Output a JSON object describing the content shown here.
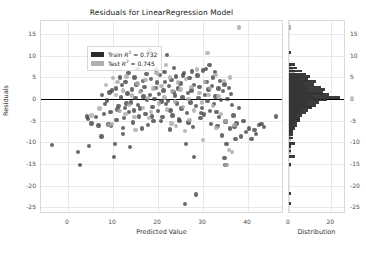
{
  "chart_data": {
    "type": "scatter",
    "title": "Residuals for LinearRegression Model",
    "xlabel": "Predicted Value",
    "ylabel": "Residuals",
    "xlim": [
      -6,
      48
    ],
    "ylim": [
      -26.5,
      18
    ],
    "xticks": [
      0,
      10,
      20,
      30,
      40
    ],
    "yticks": [
      15,
      10,
      5,
      0,
      -5,
      -10,
      -15,
      -20,
      -25
    ],
    "grid": true,
    "zero_line": 0,
    "legend": {
      "position": "upper-left",
      "entries": [
        {
          "name": "train",
          "label_prefix": "Train ",
          "label_r": "R",
          "label_sup": "2",
          "label_suffix": " = 0.732",
          "value": 0.732,
          "color": "#2b2b2b"
        },
        {
          "name": "test",
          "label_prefix": "Test ",
          "label_r": "R",
          "label_sup": "2",
          "label_suffix": " = 0.745",
          "value": 0.745,
          "color": "#b0b0b0"
        }
      ]
    },
    "series": [
      {
        "name": "Train",
        "color": "#3f3f3f",
        "points": [
          [
            -3.6,
            -10.6
          ],
          [
            2.2,
            -12.2
          ],
          [
            2.6,
            -15.2
          ],
          [
            4.6,
            -10.8
          ],
          [
            4.2,
            -4.0
          ],
          [
            4.5,
            -4.6
          ],
          [
            5.2,
            -5.6
          ],
          [
            6.8,
            -6.1
          ],
          [
            7.4,
            -8.6
          ],
          [
            8.0,
            -3.5
          ],
          [
            8.6,
            -0.3
          ],
          [
            9.0,
            -5.9
          ],
          [
            9.6,
            -6.2
          ],
          [
            10.2,
            -13.4
          ],
          [
            10.4,
            -10.3
          ],
          [
            9.2,
            1.5
          ],
          [
            9.8,
            2.0
          ],
          [
            10.6,
            2.4
          ],
          [
            11.2,
            -1.6
          ],
          [
            11.0,
            -2.4
          ],
          [
            11.8,
            0.4
          ],
          [
            12.2,
            -6.6
          ],
          [
            12.6,
            -2.0
          ],
          [
            12.0,
            3.2
          ],
          [
            12.8,
            4.0
          ],
          [
            13.2,
            1.3
          ],
          [
            13.0,
            -1.0
          ],
          [
            13.6,
            -3.0
          ],
          [
            13.8,
            -11.0
          ],
          [
            14.2,
            2.2
          ],
          [
            14.0,
            -0.8
          ],
          [
            14.6,
            -2.6
          ],
          [
            14.8,
            5.0
          ],
          [
            15.2,
            3.4
          ],
          [
            15.0,
            0.2
          ],
          [
            15.6,
            -1.4
          ],
          [
            15.8,
            -4.0
          ],
          [
            16.2,
            1.8
          ],
          [
            16.0,
            -2.2
          ],
          [
            16.6,
            4.2
          ],
          [
            16.8,
            0.6
          ],
          [
            17.2,
            -3.4
          ],
          [
            17.0,
            2.8
          ],
          [
            17.6,
            -0.2
          ],
          [
            17.8,
            -6.0
          ],
          [
            18.0,
            11.2
          ],
          [
            18.4,
            4.6
          ],
          [
            18.2,
            1.0
          ],
          [
            18.8,
            -1.8
          ],
          [
            19.0,
            -5.1
          ],
          [
            19.4,
            2.6
          ],
          [
            19.2,
            0.0
          ],
          [
            19.8,
            3.8
          ],
          [
            20.0,
            -2.8
          ],
          [
            20.4,
            5.6
          ],
          [
            20.2,
            1.2
          ],
          [
            20.8,
            -0.6
          ],
          [
            21.0,
            -4.2
          ],
          [
            21.4,
            6.2
          ],
          [
            21.2,
            2.0
          ],
          [
            21.8,
            -1.2
          ],
          [
            22.0,
            10.2
          ],
          [
            22.4,
            3.0
          ],
          [
            22.2,
            -0.4
          ],
          [
            22.8,
            -2.6
          ],
          [
            23.0,
            4.4
          ],
          [
            23.4,
            1.6
          ],
          [
            23.2,
            -3.8
          ],
          [
            23.8,
            0.8
          ],
          [
            24.0,
            5.2
          ],
          [
            24.4,
            2.4
          ],
          [
            24.2,
            -1.0
          ],
          [
            24.8,
            -5.0
          ],
          [
            25.0,
            3.6
          ],
          [
            25.4,
            0.4
          ],
          [
            25.2,
            -2.2
          ],
          [
            25.8,
            6.0
          ],
          [
            26.0,
            -24.2
          ],
          [
            26.2,
            -10.4
          ],
          [
            26.6,
            1.4
          ],
          [
            26.4,
            -3.2
          ],
          [
            27.0,
            4.8
          ],
          [
            27.4,
            2.0
          ],
          [
            27.2,
            -0.8
          ],
          [
            27.8,
            -6.4
          ],
          [
            28.0,
            3.2
          ],
          [
            28.4,
            -1.6
          ],
          [
            28.5,
            -22.0
          ],
          [
            28.8,
            5.4
          ],
          [
            29.0,
            0.2
          ],
          [
            29.4,
            -4.4
          ],
          [
            29.2,
            2.8
          ],
          [
            29.8,
            -2.0
          ],
          [
            30.0,
            6.6
          ],
          [
            30.4,
            1.0
          ],
          [
            30.2,
            -3.6
          ],
          [
            30.8,
            4.0
          ],
          [
            31.0,
            -0.4
          ],
          [
            31.4,
            7.8
          ],
          [
            31.2,
            2.2
          ],
          [
            31.8,
            -5.8
          ],
          [
            32.0,
            3.0
          ],
          [
            32.4,
            -1.2
          ],
          [
            32.2,
            5.0
          ],
          [
            32.8,
            0.6
          ],
          [
            33.0,
            -3.0
          ],
          [
            33.4,
            2.4
          ],
          [
            33.2,
            -6.2
          ],
          [
            33.8,
            4.2
          ],
          [
            34.0,
            -0.2
          ],
          [
            34.4,
            1.8
          ],
          [
            34.2,
            -8.4
          ],
          [
            34.8,
            3.4
          ],
          [
            35.0,
            -5.2
          ],
          [
            35.4,
            0.0
          ],
          [
            35.2,
            -10.4
          ],
          [
            35.8,
            2.6
          ],
          [
            36.0,
            -6.8
          ],
          [
            36.4,
            -1.4
          ],
          [
            36.2,
            1.2
          ],
          [
            36.8,
            -3.8
          ],
          [
            37.0,
            -6.4
          ],
          [
            37.4,
            -5.6
          ],
          [
            37.2,
            -9.2
          ],
          [
            38.0,
            -2.0
          ],
          [
            38.4,
            -8.6
          ],
          [
            39.0,
            -5.0
          ],
          [
            39.6,
            -7.6
          ],
          [
            40.2,
            -6.8
          ],
          [
            40.8,
            -9.2
          ],
          [
            41.4,
            -7.2
          ],
          [
            41.8,
            -8.0
          ],
          [
            42.4,
            -6.0
          ],
          [
            43.0,
            -5.8
          ],
          [
            43.6,
            -6.4
          ],
          [
            46.2,
            -4.0
          ],
          [
            28.0,
            -13.4
          ],
          [
            34.8,
            -13.6
          ],
          [
            35.0,
            -15.2
          ],
          [
            7.5,
            1.0
          ],
          [
            8.2,
            -1.2
          ],
          [
            10.8,
            -4.8
          ],
          [
            11.5,
            5.0
          ],
          [
            12.4,
            -4.4
          ],
          [
            13.4,
            6.0
          ],
          [
            14.4,
            -5.4
          ],
          [
            15.4,
            7.0
          ],
          [
            16.4,
            -6.8
          ],
          [
            17.4,
            5.8
          ],
          [
            18.6,
            -4.0
          ],
          [
            19.6,
            6.8
          ],
          [
            20.6,
            -5.0
          ],
          [
            21.6,
            4.0
          ],
          [
            22.6,
            -7.0
          ],
          [
            23.6,
            7.2
          ],
          [
            24.6,
            -4.6
          ],
          [
            25.6,
            5.4
          ],
          [
            26.8,
            -5.4
          ],
          [
            27.6,
            6.4
          ],
          [
            29.6,
            -3.2
          ],
          [
            30.6,
            7.0
          ],
          [
            31.6,
            -2.8
          ],
          [
            32.6,
            6.2
          ],
          [
            33.6,
            -4.2
          ],
          [
            12.2,
            -8.0
          ],
          [
            9.4,
            -3.0
          ],
          [
            6.2,
            -4.2
          ]
        ]
      },
      {
        "name": "Test",
        "color": "#a9a9a9",
        "points": [
          [
            5.2,
            -3.8
          ],
          [
            7.0,
            -2.2
          ],
          [
            8.4,
            3.2
          ],
          [
            9.2,
            -6.0
          ],
          [
            10.0,
            4.8
          ],
          [
            10.6,
            1.0
          ],
          [
            11.4,
            -2.8
          ],
          [
            12.2,
            2.0
          ],
          [
            13.0,
            5.2
          ],
          [
            13.6,
            -1.4
          ],
          [
            14.2,
            0.8
          ],
          [
            14.8,
            -4.2
          ],
          [
            15.4,
            3.6
          ],
          [
            16.0,
            1.6
          ],
          [
            16.6,
            -2.0
          ],
          [
            17.2,
            4.4
          ],
          [
            17.8,
            0.2
          ],
          [
            18.4,
            -3.0
          ],
          [
            19.0,
            2.4
          ],
          [
            19.6,
            6.0
          ],
          [
            20.2,
            -1.0
          ],
          [
            20.8,
            3.0
          ],
          [
            21.4,
            0.4
          ],
          [
            22.0,
            -2.4
          ],
          [
            22.6,
            5.0
          ],
          [
            23.2,
            1.8
          ],
          [
            23.8,
            -0.6
          ],
          [
            24.4,
            3.8
          ],
          [
            25.0,
            2.2
          ],
          [
            25.6,
            -1.8
          ],
          [
            26.2,
            4.6
          ],
          [
            26.8,
            0.0
          ],
          [
            27.4,
            2.8
          ],
          [
            28.0,
            -2.6
          ],
          [
            28.6,
            6.8
          ],
          [
            29.2,
            1.4
          ],
          [
            29.8,
            -0.8
          ],
          [
            30.4,
            4.0
          ],
          [
            31.0,
            10.6
          ],
          [
            31.6,
            2.6
          ],
          [
            32.2,
            -1.6
          ],
          [
            32.8,
            5.6
          ],
          [
            33.4,
            0.6
          ],
          [
            34.0,
            -3.4
          ],
          [
            34.6,
            4.2
          ],
          [
            35.2,
            -15.2
          ],
          [
            35.8,
            -11.8
          ],
          [
            36.4,
            -12.2
          ],
          [
            36.0,
            5.0
          ],
          [
            37.0,
            -6.0
          ],
          [
            38.0,
            16.5
          ],
          [
            21.8,
            7.8
          ],
          [
            24.0,
            -6.2
          ],
          [
            18.0,
            -4.4
          ],
          [
            11.0,
            4.0
          ],
          [
            9.8,
            -5.8
          ],
          [
            15.0,
            -7.2
          ],
          [
            30.0,
            -9.4
          ],
          [
            33.0,
            -6.6
          ],
          [
            26.0,
            -7.4
          ],
          [
            12.8,
            -3.4
          ],
          [
            20.0,
            5.8
          ],
          [
            27.0,
            -4.8
          ],
          [
            31.2,
            1.0
          ],
          [
            23.0,
            -5.6
          ],
          [
            35.0,
            -5.0
          ]
        ]
      }
    ],
    "histogram": {
      "orientation": "horizontal",
      "xlabel": "Distribution",
      "xticks": [
        0,
        20
      ],
      "xlim": [
        0,
        27
      ],
      "bin_height": 1.0,
      "bins": [
        {
          "y": 16.5,
          "train": 0,
          "test": 1
        },
        {
          "y": 10.5,
          "train": 1,
          "test": 0
        },
        {
          "y": 7.8,
          "train": 3,
          "test": 1
        },
        {
          "y": 7.0,
          "train": 4,
          "test": 2
        },
        {
          "y": 6.3,
          "train": 6,
          "test": 3
        },
        {
          "y": 5.6,
          "train": 8,
          "test": 4
        },
        {
          "y": 5.0,
          "train": 10,
          "test": 5
        },
        {
          "y": 4.4,
          "train": 9,
          "test": 5
        },
        {
          "y": 3.8,
          "train": 13,
          "test": 7
        },
        {
          "y": 3.2,
          "train": 12,
          "test": 6
        },
        {
          "y": 2.6,
          "train": 15,
          "test": 8
        },
        {
          "y": 2.0,
          "train": 17,
          "test": 9
        },
        {
          "y": 1.4,
          "train": 16,
          "test": 9
        },
        {
          "y": 0.8,
          "train": 19,
          "test": 10
        },
        {
          "y": 0.2,
          "train": 24,
          "test": 12
        },
        {
          "y": -0.4,
          "train": 18,
          "test": 10
        },
        {
          "y": -1.0,
          "train": 14,
          "test": 8
        },
        {
          "y": -1.6,
          "train": 13,
          "test": 7
        },
        {
          "y": -2.2,
          "train": 11,
          "test": 6
        },
        {
          "y": -2.8,
          "train": 9,
          "test": 5
        },
        {
          "y": -3.4,
          "train": 8,
          "test": 4
        },
        {
          "y": -4.0,
          "train": 6,
          "test": 4
        },
        {
          "y": -4.6,
          "train": 5,
          "test": 3
        },
        {
          "y": -5.2,
          "train": 5,
          "test": 3
        },
        {
          "y": -5.8,
          "train": 4,
          "test": 2
        },
        {
          "y": -6.4,
          "train": 4,
          "test": 2
        },
        {
          "y": -7.0,
          "train": 3,
          "test": 2
        },
        {
          "y": -7.6,
          "train": 2,
          "test": 1
        },
        {
          "y": -8.4,
          "train": 2,
          "test": 1
        },
        {
          "y": -9.2,
          "train": 2,
          "test": 1
        },
        {
          "y": -10.4,
          "train": 3,
          "test": 1
        },
        {
          "y": -11.2,
          "train": 1,
          "test": 1
        },
        {
          "y": -12.2,
          "train": 1,
          "test": 1
        },
        {
          "y": -13.4,
          "train": 3,
          "test": 0
        },
        {
          "y": -15.2,
          "train": 1,
          "test": 1
        },
        {
          "y": -22.0,
          "train": 1,
          "test": 0
        },
        {
          "y": -24.2,
          "train": 1,
          "test": 0
        }
      ]
    }
  }
}
